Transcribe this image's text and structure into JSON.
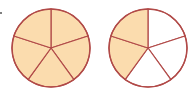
{
  "diagram": {
    "type": "fraction-circles",
    "colors": {
      "fill": "#fbdcae",
      "empty": "#ffffff",
      "stroke": "#b14a48"
    },
    "circles": [
      {
        "name": "left-circle",
        "cx": 51,
        "cy": 48,
        "r": 39,
        "segments": 5,
        "shaded": [
          0,
          1,
          2,
          3,
          4
        ]
      },
      {
        "name": "right-circle",
        "cx": 148,
        "cy": 48,
        "r": 39,
        "segments": 5,
        "shaded": [
          3,
          4
        ]
      }
    ]
  }
}
